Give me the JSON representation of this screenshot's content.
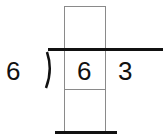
{
  "problem": {
    "divisor": "6",
    "dividend_digits": [
      "6",
      "3"
    ],
    "quotient_boxes": [
      ""
    ],
    "work_boxes": [
      ""
    ]
  }
}
